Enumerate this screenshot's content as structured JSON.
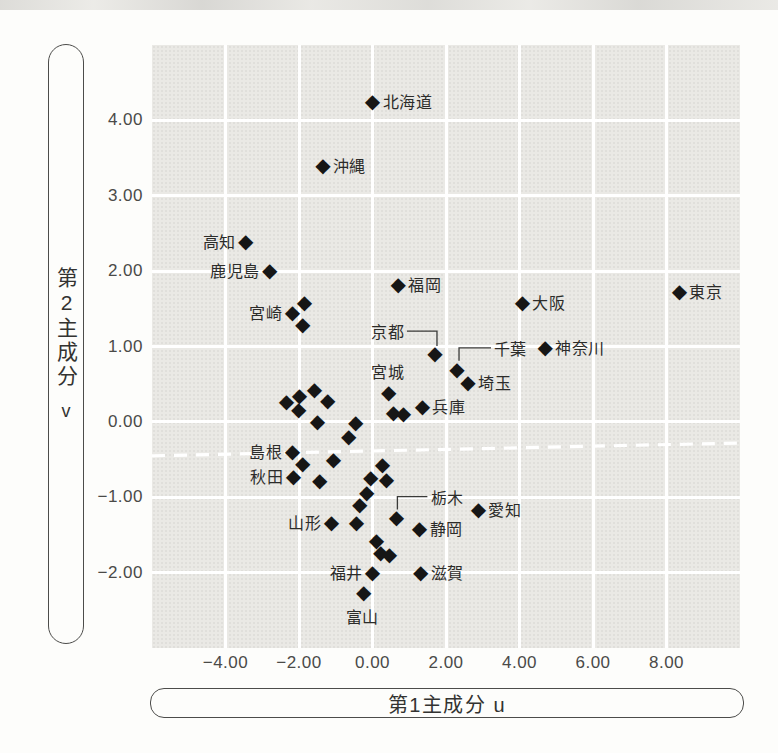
{
  "chart_data": {
    "type": "scatter",
    "marker_glyph": "◆",
    "marker_color": "#161616",
    "plot_bg": "#eae9e5",
    "grid_color": "#ffffff",
    "x_axis": {
      "label": "第1主成分 u",
      "range": [
        -6,
        10
      ],
      "ticks": [
        {
          "value": -4,
          "label": "−4.00"
        },
        {
          "value": -2,
          "label": "−2.00"
        },
        {
          "value": 0,
          "label": "0.00"
        },
        {
          "value": 2,
          "label": "2.00"
        },
        {
          "value": 4,
          "label": "4.00"
        },
        {
          "value": 6,
          "label": "6.00"
        },
        {
          "value": 8,
          "label": "8.00"
        }
      ]
    },
    "y_axis": {
      "label": "第2主成分",
      "unit": "v",
      "range": [
        -3,
        5
      ],
      "ticks": [
        {
          "value": 4,
          "label": "4.00"
        },
        {
          "value": 3,
          "label": "3.00"
        },
        {
          "value": 2,
          "label": "2.00"
        },
        {
          "value": 1,
          "label": "1.00"
        },
        {
          "value": 0,
          "label": "0.00"
        },
        {
          "value": -1,
          "label": "−1.00"
        },
        {
          "value": -2,
          "label": "−2.00"
        }
      ]
    },
    "dashed_line": {
      "u1": -6,
      "v1": -0.45,
      "u2": 10,
      "v2": -0.28,
      "color": "#ffffff"
    },
    "points": [
      {
        "name": "北海道",
        "u": 0.0,
        "v": 4.25,
        "side": "right"
      },
      {
        "name": "沖縄",
        "u": -1.35,
        "v": 3.4,
        "side": "right"
      },
      {
        "name": "高知",
        "u": -3.45,
        "v": 2.38,
        "side": "left"
      },
      {
        "name": "鹿児島",
        "u": -2.8,
        "v": 2.0,
        "side": "left"
      },
      {
        "name": "宮崎",
        "u": -2.18,
        "v": 1.45,
        "side": "left"
      },
      {
        "name": "福岡",
        "u": 0.7,
        "v": 1.82,
        "side": "right"
      },
      {
        "name": "大阪",
        "u": 4.08,
        "v": 1.58,
        "side": "right"
      },
      {
        "name": "東京",
        "u": 8.35,
        "v": 1.72,
        "side": "right"
      },
      {
        "name": "神奈川",
        "u": 4.7,
        "v": 0.98,
        "side": "right"
      },
      {
        "name": "京都",
        "u": 1.7,
        "v": 0.9,
        "side": "callout",
        "label_offset": [
          -47,
          -23
        ],
        "connector": [
          [
            -28,
            -23
          ],
          [
            2,
            -23
          ],
          [
            2,
            -8
          ]
        ]
      },
      {
        "name": "千葉",
        "u": 2.3,
        "v": 0.69,
        "side": "callout",
        "label_offset": [
          53,
          -22
        ],
        "connector": [
          [
            34,
            -22
          ],
          [
            2,
            -22
          ],
          [
            2,
            -9
          ]
        ]
      },
      {
        "name": "埼玉",
        "u": 2.6,
        "v": 0.52,
        "side": "right"
      },
      {
        "name": "宮城",
        "u": 0.44,
        "v": 0.38,
        "side": "above"
      },
      {
        "name": "兵庫",
        "u": 1.36,
        "v": 0.2,
        "side": "right"
      },
      {
        "name": "島根",
        "u": -2.18,
        "v": -0.4,
        "side": "left"
      },
      {
        "name": "秋田",
        "u": -2.15,
        "v": -0.73,
        "side": "left"
      },
      {
        "name": "栃木",
        "u": 0.65,
        "v": -1.27,
        "side": "callout",
        "label_offset": [
          51,
          -21
        ],
        "connector": [
          [
            31,
            -21
          ],
          [
            1,
            -21
          ],
          [
            1,
            -8
          ]
        ]
      },
      {
        "name": "愛知",
        "u": 2.88,
        "v": -1.17,
        "side": "right"
      },
      {
        "name": "山形",
        "u": -1.12,
        "v": -1.34,
        "side": "left"
      },
      {
        "name": "静岡",
        "u": 1.28,
        "v": -1.42,
        "side": "right"
      },
      {
        "name": "福井",
        "u": 0.0,
        "v": -2.0,
        "side": "left"
      },
      {
        "name": "滋賀",
        "u": 1.31,
        "v": -2.0,
        "side": "right"
      },
      {
        "name": "富山",
        "u": -0.24,
        "v": -2.27,
        "side": "below"
      },
      {
        "name": "",
        "u": -1.85,
        "v": 1.58,
        "side": "none"
      },
      {
        "name": "",
        "u": -1.9,
        "v": 1.29,
        "side": "none"
      },
      {
        "name": "",
        "u": -2.34,
        "v": 0.27,
        "side": "none"
      },
      {
        "name": "",
        "u": -1.99,
        "v": 0.34,
        "side": "none"
      },
      {
        "name": "",
        "u": -1.58,
        "v": 0.42,
        "side": "none"
      },
      {
        "name": "",
        "u": -1.22,
        "v": 0.28,
        "side": "none"
      },
      {
        "name": "",
        "u": -2.01,
        "v": 0.16,
        "side": "none"
      },
      {
        "name": "",
        "u": -1.5,
        "v": 0.0,
        "side": "none"
      },
      {
        "name": "",
        "u": -0.46,
        "v": -0.01,
        "side": "none"
      },
      {
        "name": "",
        "u": -0.65,
        "v": -0.2,
        "side": "none"
      },
      {
        "name": "",
        "u": 0.57,
        "v": 0.12,
        "side": "none"
      },
      {
        "name": "",
        "u": 0.84,
        "v": 0.11,
        "side": "none"
      },
      {
        "name": "",
        "u": -1.9,
        "v": -0.56,
        "side": "none"
      },
      {
        "name": "",
        "u": -1.06,
        "v": -0.5,
        "side": "none"
      },
      {
        "name": "",
        "u": -1.44,
        "v": -0.78,
        "side": "none"
      },
      {
        "name": "",
        "u": 0.27,
        "v": -0.57,
        "side": "none"
      },
      {
        "name": "",
        "u": -0.05,
        "v": -0.74,
        "side": "none"
      },
      {
        "name": "",
        "u": 0.38,
        "v": -0.77,
        "side": "none"
      },
      {
        "name": "",
        "u": -0.16,
        "v": -0.94,
        "side": "none"
      },
      {
        "name": "",
        "u": -0.35,
        "v": -1.1,
        "side": "none"
      },
      {
        "name": "",
        "u": -0.44,
        "v": -1.34,
        "side": "none"
      },
      {
        "name": "",
        "u": 0.11,
        "v": -1.58,
        "side": "none"
      },
      {
        "name": "",
        "u": 0.22,
        "v": -1.74,
        "side": "none"
      },
      {
        "name": "",
        "u": 0.46,
        "v": -1.76,
        "side": "none"
      }
    ]
  }
}
